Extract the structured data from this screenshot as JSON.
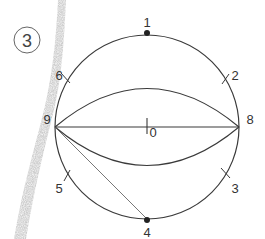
{
  "step": {
    "number": "3"
  },
  "colors": {
    "line": "#3a3a3a",
    "thin_line": "#555555",
    "dot": "#222222",
    "smudge": "#b8b8b8",
    "background": "#ffffff"
  },
  "points": {
    "p0": "0",
    "p1": "1",
    "p2": "2",
    "p3": "3",
    "p4": "4",
    "p5": "5",
    "p6": "6",
    "p8": "8",
    "p9": "9"
  },
  "diagram": {
    "type": "circle-division-construction",
    "circle": {
      "cx": 147,
      "cy": 127,
      "r": 92
    }
  }
}
